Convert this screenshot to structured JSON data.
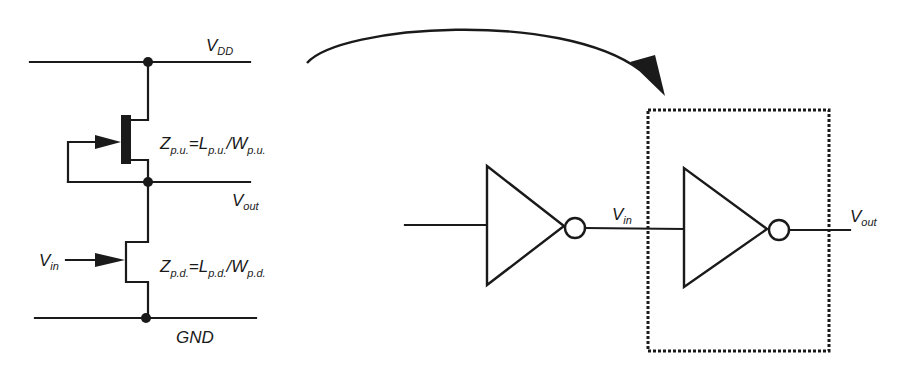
{
  "diagram": {
    "type": "circuit",
    "left_schematic": {
      "rails": {
        "vdd": {
          "base": "V",
          "sub": "DD"
        },
        "gnd": {
          "label": "GND"
        }
      },
      "nodes": {
        "vout": {
          "base": "V",
          "sub": "out"
        },
        "vin": {
          "base": "V",
          "sub": "in"
        }
      },
      "pull_up": {
        "z": {
          "base": "Z",
          "sub": "p.u."
        },
        "eq": "=",
        "l": {
          "base": "L",
          "sub": "p.u."
        },
        "slash": "/",
        "w": {
          "base": "W",
          "sub": "p.u."
        }
      },
      "pull_down": {
        "z": {
          "base": "Z",
          "sub": "p.d."
        },
        "eq": "=",
        "l": {
          "base": "L",
          "sub": "p.d."
        },
        "slash": "/",
        "w": {
          "base": "W",
          "sub": "p.d."
        }
      }
    },
    "right_schematic": {
      "inverter_chain": [
        {
          "name": "driver-inverter"
        },
        {
          "name": "load-inverter",
          "highlighted": true
        }
      ],
      "labels": {
        "vin": {
          "base": "V",
          "sub": "in"
        },
        "vout": {
          "base": "V",
          "sub": "out"
        }
      }
    },
    "colors": {
      "ink": "#1a1a1a",
      "background": "#ffffff"
    }
  }
}
